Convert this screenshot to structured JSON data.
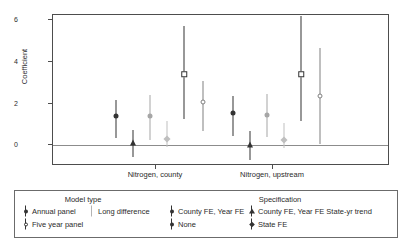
{
  "chart_data": {
    "type": "scatter",
    "title": "",
    "xlabel": "",
    "ylabel": "Coefficient",
    "ylim": [
      -1,
      6
    ],
    "yticks": [
      0,
      2,
      4,
      6
    ],
    "ytick_labels": [
      "0",
      "2",
      "4",
      "6"
    ],
    "grid": false,
    "zero_reference_line": 0,
    "categories": [
      "Nitrogen, county",
      "Nitrogen, upstream"
    ],
    "legend_position": "below-plot",
    "series": [
      {
        "name": "Annual panel / County FE, Year FE",
        "model_type": "Annual panel",
        "specification": "County FE, Year FE",
        "marker": "filled-circle",
        "color": "#333333",
        "values": [
          1.4,
          1.55
        ],
        "ci_low": [
          0.35,
          0.45
        ],
        "ci_high": [
          2.15,
          2.35
        ]
      },
      {
        "name": "Annual panel / County FE, Year FE State-yr trend",
        "model_type": "Annual panel",
        "specification": "County FE, Year FE State-yr trend",
        "marker": "filled-triangle",
        "color": "#333333",
        "values": [
          0.1,
          0.0
        ],
        "ci_low": [
          -0.55,
          -0.7
        ],
        "ci_high": [
          0.75,
          0.7
        ]
      },
      {
        "name": "Long difference / County FE, Year FE",
        "model_type": "Long difference",
        "specification": "County FE, Year FE",
        "marker": "filled-circle",
        "color": "#a6a6a6",
        "values": [
          1.4,
          1.45
        ],
        "ci_low": [
          0.25,
          0.4
        ],
        "ci_high": [
          2.4,
          2.45
        ]
      },
      {
        "name": "Long difference / State FE",
        "model_type": "Long difference",
        "specification": "State FE",
        "marker": "filled-diamond",
        "color": "#bfbfbf",
        "values": [
          0.3,
          0.25
        ],
        "ci_low": [
          -0.1,
          -0.15
        ],
        "ci_high": [
          1.15,
          1.05
        ]
      },
      {
        "name": "Five year panel / None",
        "model_type": "Five year panel",
        "specification": "None",
        "marker": "open-square",
        "color": "#333333",
        "values": [
          3.4,
          3.4
        ],
        "ci_low": [
          1.25,
          1.15
        ],
        "ci_high": [
          5.7,
          6.2
        ]
      },
      {
        "name": "Five year panel / State FE",
        "model_type": "Five year panel",
        "specification": "State FE",
        "marker": "open-circle",
        "color": "#808080",
        "values": [
          2.05,
          2.35
        ],
        "ci_low": [
          0.7,
          0.05
        ],
        "ci_high": [
          3.1,
          4.65
        ]
      }
    ]
  },
  "axis": {
    "y_label": "Coefficient",
    "y_ticks": [
      "6",
      "4",
      "2",
      "0"
    ],
    "x_labels": [
      "Nitrogen, county",
      "Nitrogen, upstream"
    ]
  },
  "legend": {
    "title_model": "Model type",
    "title_spec": "Specification",
    "items": [
      {
        "label": "Annual panel",
        "icon": "filled-circle-with-bar-icon",
        "column": 1,
        "row": 1
      },
      {
        "label": "Five year panel",
        "icon": "open-circle-with-bar-icon",
        "column": 1,
        "row": 2
      },
      {
        "label": "Long difference",
        "icon": "gray-bar-icon",
        "column": 2,
        "row": 1
      },
      {
        "label": "County FE, Year FE",
        "icon": "filled-circle-with-bar-icon",
        "column": 3,
        "row": 1
      },
      {
        "label": "None",
        "icon": "filled-circle-with-bar-icon",
        "column": 3,
        "row": 2
      },
      {
        "label": "County FE, Year FE State-yr trend",
        "icon": "filled-triangle-with-bar-icon",
        "column": 4,
        "row": 1
      },
      {
        "label": "State FE",
        "icon": "filled-diamond-with-bar-icon",
        "column": 4,
        "row": 2
      }
    ]
  },
  "colors": {
    "dark": "#333333",
    "mid_gray": "#808080",
    "light_gray": "#bfbfbf",
    "axis": "#4d4d4d",
    "zero_line": "#8c8c8c"
  }
}
